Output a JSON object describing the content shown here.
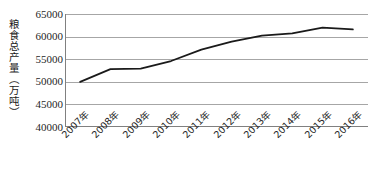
{
  "chart_data": {
    "type": "line",
    "title": "",
    "subtitle": "",
    "xlabel": "",
    "ylabel": "粮食总产量（万吨）",
    "categories": [
      "2007年",
      "2008年",
      "2009年",
      "2010年",
      "2011年",
      "2012年",
      "2013年",
      "2014年",
      "2015年",
      "2016年"
    ],
    "series": [
      {
        "name": "粮食总产量",
        "values": [
          50000,
          52800,
          52900,
          54600,
          57100,
          58900,
          60200,
          60700,
          62000,
          61600
        ],
        "color": "#1a1a1a"
      }
    ],
    "ylim": [
      40000,
      65000
    ],
    "yticks": [
      40000,
      45000,
      50000,
      55000,
      60000,
      65000
    ],
    "ytick_labels": [
      "40000",
      "45000",
      "50000",
      "55000",
      "60000",
      "65000"
    ],
    "grid": true,
    "grid_axis": "y",
    "grid_color": "#a6a6a6",
    "legend": false,
    "legend_position": "none",
    "axis_color": "#808080",
    "line_width": 1.8
  },
  "axis": {
    "y_title": "粮食总产量（万吨）"
  }
}
